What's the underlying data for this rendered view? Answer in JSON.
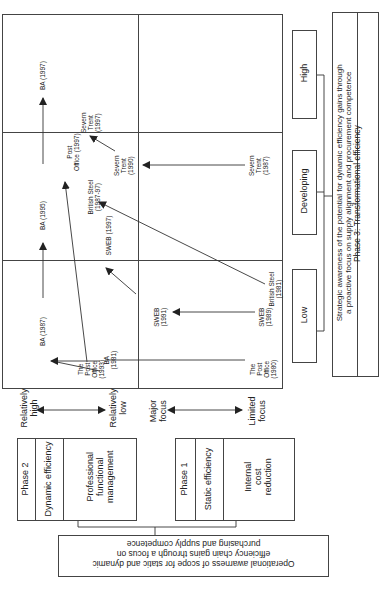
{
  "grid": {
    "labels": {
      "ba_1997": "BA (1997)",
      "ba_1995": "BA (1995)",
      "ba_1987": "BA (1987)",
      "ba_1981": [
        "BA",
        "(1981)"
      ],
      "severn_1997": [
        "Severn",
        "Trent",
        "(1997)"
      ],
      "severn_1990": [
        "Severn",
        "Trent",
        "(1990)"
      ],
      "severn_1987": [
        "Severn",
        "Trent",
        "(1987)"
      ],
      "post_1997": [
        "Post",
        "Office (1997)"
      ],
      "post_1993": [
        "The",
        "Post",
        "Office",
        "(1993)"
      ],
      "post_1980": [
        "The",
        "Post",
        "Office",
        "(1980)"
      ],
      "bs_1987": [
        "British Steel",
        "(1987-97)"
      ],
      "bs_1981": [
        "British Steel",
        "(1981)"
      ],
      "sweb_1997": "SWEB  (1997)",
      "sweb_1991": [
        "SWEB",
        "(1991)"
      ],
      "sweb_1989": [
        "SWEB",
        "(1989)"
      ]
    }
  },
  "levels": {
    "high": "High",
    "developing": "Developing",
    "low": "Low"
  },
  "phase3": {
    "description_line1": "Strategic awareness of the potential for dynamic efficiency gains through",
    "description_line2": "a proactive focus on supply alignment and procurement competence",
    "title": "Phase 3: Transformational efficiency"
  },
  "axes": {
    "dynamic_high": [
      "Relatively",
      "high"
    ],
    "dynamic_low": [
      "Relatively",
      "low"
    ],
    "static_major": [
      "Major",
      "focus"
    ],
    "static_limited": [
      "Limited",
      "focus"
    ]
  },
  "phase2": {
    "phase": "Phase 2",
    "type": "Dynamic efficiency",
    "focus": [
      "Professional",
      "functional",
      "management"
    ]
  },
  "phase1": {
    "phase": "Phase 1",
    "type": "Static efficiency",
    "focus": [
      "Internal",
      "cost",
      "reduction"
    ]
  },
  "operational": {
    "line1": "Operational awarness of scope for static and dynamic",
    "line2": "efficiency chain gains through a focus on",
    "line3": "purchasing and supply competence"
  }
}
